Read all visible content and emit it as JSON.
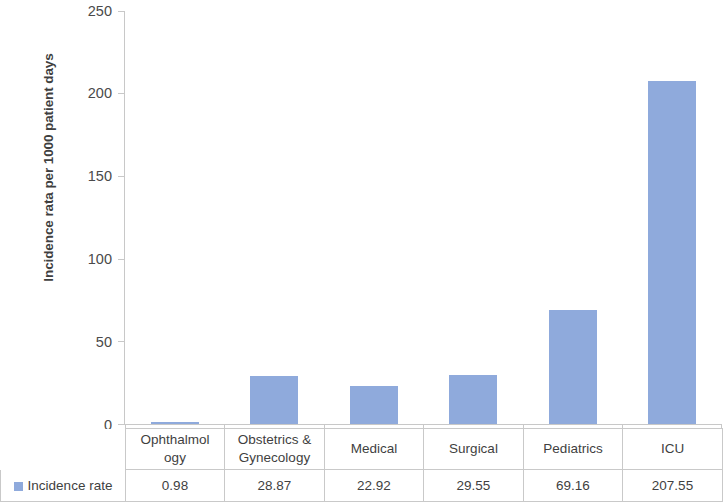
{
  "chart_data": {
    "type": "bar",
    "title": "",
    "xlabel": "",
    "ylabel": "Incidence rata per 1000 patient days",
    "categories": [
      "Ophthalmology",
      "Obstetrics & Gynecology",
      "Medical",
      "Surgical",
      "Pediatrics",
      "ICU"
    ],
    "category_display": [
      "Ophthalmol ogy",
      "Obstetrics & Gynecology",
      "Medical",
      "Surgical",
      "Pediatrics",
      "ICU"
    ],
    "series": [
      {
        "name": "Incidence rate",
        "values": [
          0.98,
          28.87,
          22.92,
          29.55,
          69.16,
          207.55
        ],
        "value_labels": [
          "0.98",
          "28.87",
          "22.92",
          "29.55",
          "69.16",
          "207.55"
        ],
        "color": "#8faadc"
      }
    ],
    "ylim": [
      0,
      250
    ],
    "yticks": [
      0,
      50,
      100,
      150,
      200,
      250
    ],
    "ytick_labels": [
      "0",
      "50",
      "100",
      "150",
      "200",
      "250"
    ],
    "grid": false,
    "legend_position": "bottom-table",
    "has_data_table": true
  },
  "axis": {
    "y_title": "Incidence rata per 1000 patient days",
    "tick_labels": [
      "250",
      "200",
      "150",
      "100",
      "50",
      "0"
    ]
  },
  "table": {
    "header_lines": [
      [
        "Ophthalmol",
        "ogy"
      ],
      [
        "Obstetrics &",
        "Gynecology"
      ],
      [
        "Medical",
        ""
      ],
      [
        "Surgical",
        ""
      ],
      [
        "Pediatrics",
        ""
      ],
      [
        "ICU",
        ""
      ]
    ],
    "legend_label": "Incidence rate",
    "values": [
      "0.98",
      "28.87",
      "22.92",
      "29.55",
      "69.16",
      "207.55"
    ]
  },
  "colors": {
    "bar": "#8faadc",
    "axis": "#c8c8c8",
    "table_border": "#c9c9c9",
    "text": "#3f3f3f"
  }
}
